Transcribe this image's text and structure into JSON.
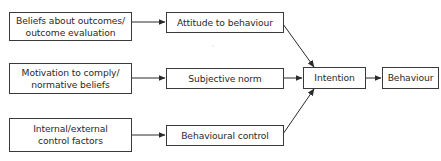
{
  "diagram": {
    "sources": [
      {
        "id": "beliefs",
        "line1": "Beliefs about outcomes/",
        "line2": "outcome evaluation"
      },
      {
        "id": "motivation",
        "line1": "Motivation to comply/",
        "line2": "normative beliefs"
      },
      {
        "id": "control-factors",
        "line1": "Internal/external",
        "line2": "control factors"
      }
    ],
    "mediators": [
      {
        "id": "attitude",
        "label": "Attitude to behaviour"
      },
      {
        "id": "subjective-norm",
        "label": "Subjective norm"
      },
      {
        "id": "behavioural-control",
        "label": "Behavioural control"
      }
    ],
    "intention": {
      "label": "Intention"
    },
    "behaviour": {
      "label": "Behaviour"
    },
    "edges": [
      [
        "Beliefs about outcomes/outcome evaluation",
        "Attitude to behaviour"
      ],
      [
        "Motivation to comply/normative beliefs",
        "Subjective norm"
      ],
      [
        "Internal/external control factors",
        "Behavioural control"
      ],
      [
        "Attitude to behaviour",
        "Intention"
      ],
      [
        "Subjective norm",
        "Intention"
      ],
      [
        "Behavioural control",
        "Intention"
      ],
      [
        "Intention",
        "Behaviour"
      ]
    ],
    "colors": {
      "stroke": "#3a3a3a",
      "text": "#2a2a2a",
      "background": "#ffffff"
    }
  }
}
